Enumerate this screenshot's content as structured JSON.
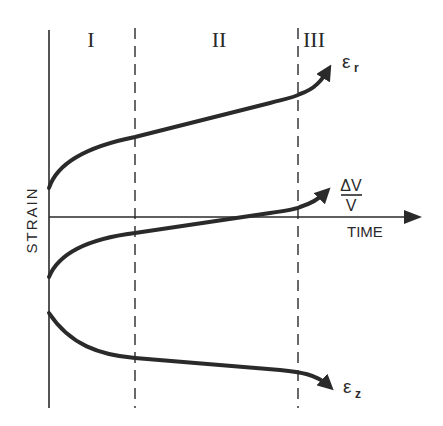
{
  "diagram": {
    "axes": {
      "ylabel": "STRAIN",
      "xlabel": "TIME"
    },
    "regions": [
      {
        "label": "I"
      },
      {
        "label": "II"
      },
      {
        "label": "III"
      }
    ],
    "curves": [
      {
        "name": "radial-strain",
        "label": "ε",
        "subscript": "r"
      },
      {
        "name": "volumetric-strain",
        "label_num": "ΔV",
        "label_den": "V"
      },
      {
        "name": "axial-strain",
        "label": "ε",
        "subscript": "z"
      }
    ],
    "colors": {
      "ink": "#2a2a2a",
      "background": "#ffffff"
    }
  }
}
